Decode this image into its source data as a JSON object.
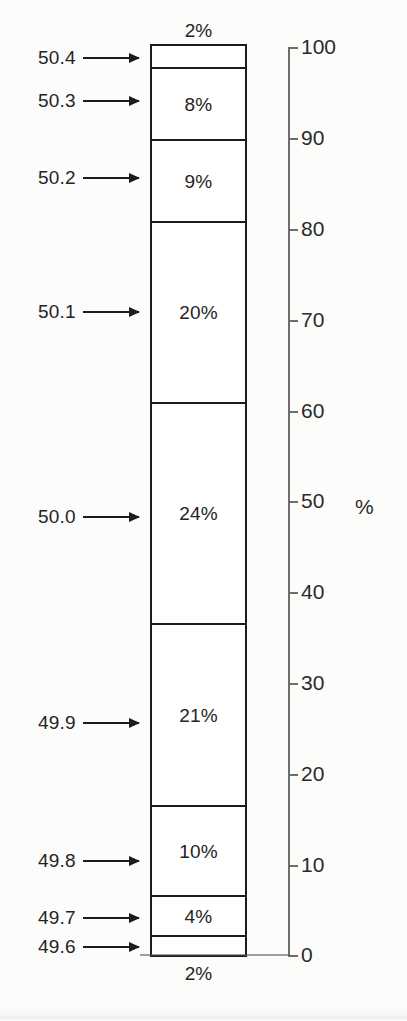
{
  "figure": {
    "axis_unit_label": "%",
    "background_color": "#fcfcfb",
    "line_color": "#1c1c1c",
    "axis_color": "#6d6d6d"
  },
  "chart_data": {
    "type": "bar",
    "title": "",
    "subtitle": "",
    "orientation": "vertical-stacked",
    "xlabel": "",
    "ylabel": "%",
    "ylim": [
      0,
      100
    ],
    "grid": false,
    "legend": "none",
    "axis_ticks": [
      {
        "value": 100,
        "label": "100",
        "y": 47
      },
      {
        "value": 90,
        "label": "90",
        "y": 138
      },
      {
        "value": 80,
        "label": "80",
        "y": 229
      },
      {
        "value": 70,
        "label": "70",
        "y": 320
      },
      {
        "value": 60,
        "label": "60",
        "y": 411
      },
      {
        "value": 50,
        "label": "50",
        "y": 501
      },
      {
        "value": 40,
        "label": "40",
        "y": 592
      },
      {
        "value": 30,
        "label": "30",
        "y": 683
      },
      {
        "value": 20,
        "label": "20",
        "y": 774
      },
      {
        "value": 10,
        "label": "10",
        "y": 865
      },
      {
        "value": 0,
        "label": "0",
        "y": 955
      }
    ],
    "categories": [
      "50.4",
      "50.3",
      "50.2",
      "50.1",
      "50.0",
      "49.9",
      "49.8",
      "49.7",
      "49.6"
    ],
    "values": [
      2,
      8,
      9,
      20,
      24,
      21,
      10,
      4,
      2
    ],
    "segments": [
      {
        "category": "50.4",
        "value": 2,
        "label": "2%",
        "label_placement": "above-outside",
        "top": 44,
        "height": 25,
        "annot_y": 58,
        "annot_text": "50.4"
      },
      {
        "category": "50.3",
        "value": 8,
        "label": "8%",
        "label_placement": "inside",
        "top": 67,
        "height": 74,
        "annot_y": 101,
        "annot_text": "50.3"
      },
      {
        "category": "50.2",
        "value": 9,
        "label": "9%",
        "label_placement": "inside",
        "top": 139,
        "height": 84,
        "annot_y": 178,
        "annot_text": "50.2"
      },
      {
        "category": "50.1",
        "value": 20,
        "label": "20%",
        "label_placement": "inside",
        "top": 221,
        "height": 183,
        "annot_y": 312,
        "annot_text": "50.1"
      },
      {
        "category": "50.0",
        "value": 24,
        "label": "24%",
        "label_placement": "inside",
        "top": 402,
        "height": 223,
        "annot_y": 517,
        "annot_text": "50.0"
      },
      {
        "category": "49.9",
        "value": 21,
        "label": "21%",
        "label_placement": "inside",
        "top": 623,
        "height": 184,
        "annot_y": 723,
        "annot_text": "49.9"
      },
      {
        "category": "49.8",
        "value": 10,
        "label": "10%",
        "label_placement": "inside",
        "top": 805,
        "height": 92,
        "annot_y": 861,
        "annot_text": "49.8"
      },
      {
        "category": "49.7",
        "value": 4,
        "label": "4%",
        "label_placement": "inside",
        "top": 895,
        "height": 42,
        "annot_y": 918,
        "annot_text": "49.7"
      },
      {
        "category": "49.6",
        "value": 2,
        "label": "2%",
        "label_placement": "below-outside",
        "top": 935,
        "height": 22,
        "annot_y": 947,
        "annot_text": "49.6"
      }
    ],
    "outside_labels": [
      {
        "text": "2%",
        "position": "top",
        "y": 20
      },
      {
        "text": "2%",
        "position": "bottom",
        "y": 963
      }
    ],
    "annotations": [
      {
        "text": "50.4",
        "y": 58,
        "text_x": 38,
        "arrow_x": 92,
        "arrow_w": 58
      },
      {
        "text": "50.3",
        "y": 101,
        "text_x": 38,
        "arrow_x": 92,
        "arrow_w": 58
      },
      {
        "text": "50.2",
        "y": 178,
        "text_x": 38,
        "arrow_x": 92,
        "arrow_w": 58
      },
      {
        "text": "50.1",
        "y": 312,
        "text_x": 38,
        "arrow_x": 92,
        "arrow_w": 58
      },
      {
        "text": "50.0",
        "y": 517,
        "text_x": 38,
        "arrow_x": 92,
        "arrow_w": 58
      },
      {
        "text": "49.9",
        "y": 723,
        "text_x": 38,
        "arrow_x": 92,
        "arrow_w": 58
      },
      {
        "text": "49.8",
        "y": 861,
        "text_x": 38,
        "arrow_x": 92,
        "arrow_w": 58
      },
      {
        "text": "49.7",
        "y": 918,
        "text_x": 38,
        "arrow_x": 92,
        "arrow_w": 58
      },
      {
        "text": "49.6",
        "y": 947,
        "text_x": 38,
        "arrow_x": 92,
        "arrow_w": 58
      }
    ]
  }
}
